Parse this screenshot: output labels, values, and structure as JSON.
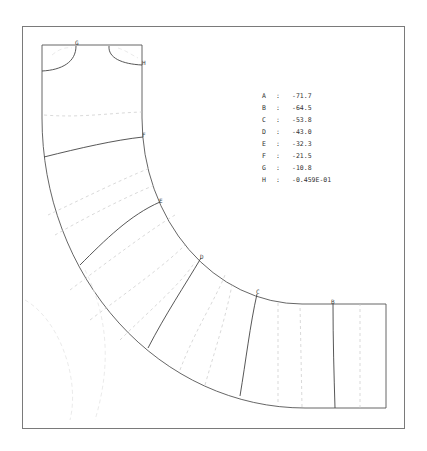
{
  "figure": {
    "type": "contour-plot",
    "contour_labels": {
      "A": "A",
      "B": "B",
      "C": "C",
      "D": "D",
      "E": "E",
      "F": "F",
      "G": "G",
      "H": "H"
    }
  },
  "legend": {
    "separator": ":",
    "entries": [
      {
        "key": "A",
        "value": "-71.7"
      },
      {
        "key": "B",
        "value": "-64.5"
      },
      {
        "key": "C",
        "value": "-53.8"
      },
      {
        "key": "D",
        "value": "-43.0"
      },
      {
        "key": "E",
        "value": "-32.3"
      },
      {
        "key": "F",
        "value": "-21.5"
      },
      {
        "key": "G",
        "value": "-10.8"
      },
      {
        "key": "H",
        "value": "-0.459E-01"
      }
    ]
  },
  "colors": {
    "line": "#444444",
    "frame": "#7a7a7a",
    "dashed": "#c8c8c8"
  }
}
